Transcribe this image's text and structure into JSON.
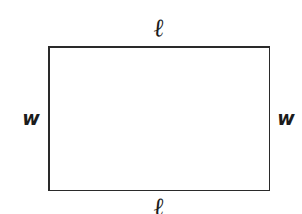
{
  "figure": {
    "type": "geometry-diagram",
    "canvas": {
      "width": 302,
      "height": 214,
      "background_color": "#ffffff"
    },
    "shape": {
      "name": "rectangle",
      "stroke_color": "#2a2a2a",
      "stroke_width": 1.5,
      "fill_color": "none",
      "left": 48,
      "top": 46,
      "right": 269,
      "bottom": 190
    },
    "labels": {
      "length_top": "ℓ",
      "length_bottom": "ℓ",
      "width_left": "w",
      "width_right": "w"
    },
    "label_color": "#1c1c1c"
  }
}
